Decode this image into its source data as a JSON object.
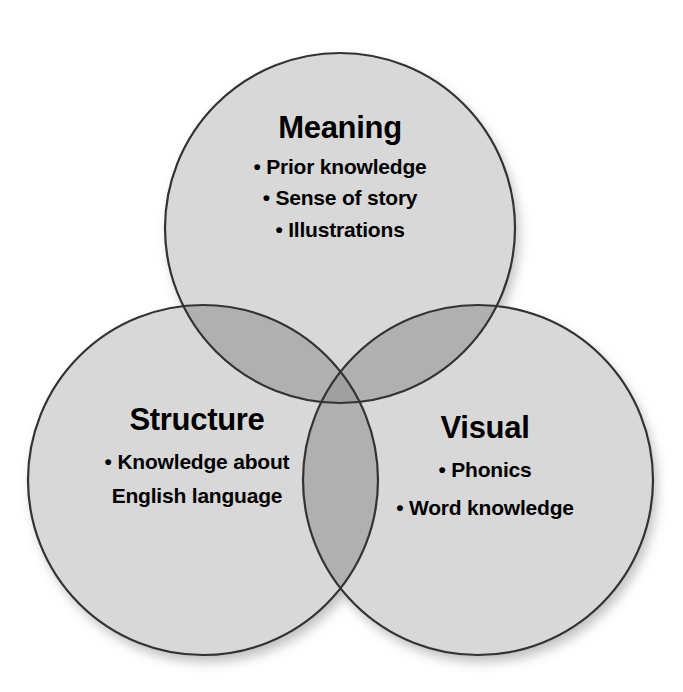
{
  "diagram": {
    "type": "venn",
    "title": "",
    "background_color": "#ffffff",
    "stroke_color": "#333333",
    "fill_single": "#d8d8d8",
    "fill_double": "#b0b0b0",
    "fill_triple": "#a0a0a0",
    "text_color": "#000000",
    "bullet_glyph": "•",
    "sets": [
      {
        "id": "meaning",
        "label": "Meaning",
        "position": "top",
        "center": {
          "x": 340,
          "y": 228
        },
        "radius": 175,
        "items": [
          "Prior knowledge",
          "Sense of story",
          "Illustrations"
        ]
      },
      {
        "id": "structure",
        "label": "Structure",
        "position": "bottom-left",
        "center": {
          "x": 203,
          "y": 480
        },
        "radius": 175,
        "items": [
          "Knowledge about English language"
        ]
      },
      {
        "id": "visual",
        "label": "Visual",
        "position": "bottom-right",
        "center": {
          "x": 478,
          "y": 480
        },
        "radius": 175,
        "items": [
          "Phonics",
          "Word knowledge"
        ]
      }
    ]
  }
}
